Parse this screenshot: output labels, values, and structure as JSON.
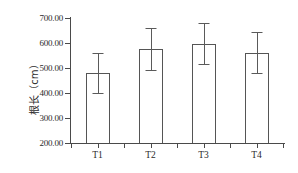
{
  "chart_data": {
    "type": "bar",
    "title": "",
    "xlabel": "",
    "ylabel": "根长（cm）",
    "categories": [
      "T1",
      "T2",
      "T3",
      "T4"
    ],
    "values": [
      482,
      576,
      598,
      560
    ],
    "errors_upper": [
      562,
      660,
      680,
      645
    ],
    "errors_lower": [
      402,
      494,
      518,
      480
    ],
    "ylim": [
      200,
      700
    ],
    "ytick_labels": [
      "700.00",
      "600.00",
      "500.00",
      "400.00",
      "300.00",
      "200.00"
    ],
    "ytick_values": [
      700,
      600,
      500,
      400,
      300,
      200
    ],
    "grid": false,
    "legend": "none",
    "series": [
      {
        "name": "根长",
        "values": [
          482,
          576,
          598,
          560
        ]
      }
    ],
    "colors": {
      "bar_fill": "#ffffff",
      "bar_edge": "#555555",
      "axis": "#4a4a4a",
      "error_bar": "#5a5a5a",
      "text": "#2b2b2b",
      "background": "#ffffff"
    }
  }
}
